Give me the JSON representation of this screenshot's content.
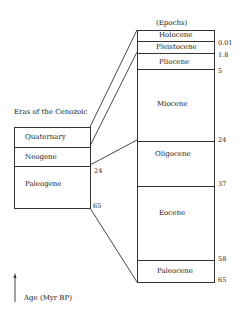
{
  "diagram": {
    "eras_title": "Eras of the Cenozoic",
    "epochs_title": "(Epochs)",
    "axis_label": "Age (Myr BP)",
    "eras": [
      {
        "name": "Quaternary"
      },
      {
        "name": "Neogene"
      },
      {
        "name": "Paleogene"
      }
    ],
    "era_boundaries": [
      "24",
      "65"
    ],
    "epochs": [
      {
        "name": "Holocene"
      },
      {
        "name": "Pleistocene"
      },
      {
        "name": "Pliocene"
      },
      {
        "name": "Miocene"
      },
      {
        "name": "Oligocene"
      },
      {
        "name": "Eocene"
      },
      {
        "name": "Paleocene"
      }
    ],
    "epoch_boundaries": [
      "0.01",
      "1.8",
      "5",
      "24",
      "37",
      "58",
      "65"
    ]
  }
}
